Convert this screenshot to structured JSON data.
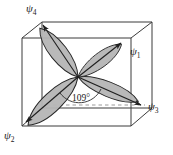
{
  "figure": {
    "labels": {
      "psi1": {
        "name": "psi",
        "subscript": "1",
        "glyph": "ψ"
      },
      "psi2": {
        "name": "psi",
        "subscript": "2",
        "glyph": "ψ"
      },
      "psi3": {
        "name": "psi",
        "subscript": "3",
        "glyph": "ψ"
      },
      "psi4": {
        "name": "psi",
        "subscript": "4",
        "glyph": "ψ"
      }
    },
    "angle_annotation": "109°",
    "colors": {
      "background": "#ffffff",
      "lobe_fill": "#b5b5b5",
      "lobe_stroke": "#262626",
      "cube_stroke": "#3b3b3b",
      "dashed_stroke": "#8f8f8f",
      "axis_stroke": "#262626",
      "text": "#1a1a1a"
    },
    "cube": {
      "front_top_left": [
        22,
        38
      ],
      "front_top_right": [
        131,
        38
      ],
      "front_bottom_left": [
        22,
        126
      ],
      "front_bottom_right": [
        131,
        126
      ],
      "back_top_left": [
        42,
        22
      ],
      "back_top_right": [
        152,
        22
      ],
      "back_bottom_left": [
        42,
        108
      ],
      "back_bottom_right": [
        152,
        108
      ]
    },
    "center": [
      78,
      77
    ],
    "lobes": [
      {
        "id": "psi1",
        "tip": [
          122,
          44
        ],
        "width": 20
      },
      {
        "id": "psi2",
        "tip": [
          25,
          122
        ],
        "width": 20
      },
      {
        "id": "psi3",
        "tip": [
          142,
          106
        ],
        "width": 18
      },
      {
        "id": "psi4",
        "tip": [
          42,
          24
        ],
        "width": 20
      }
    ],
    "dashed_guides": {
      "vertical": {
        "from": [
          42,
          24
        ],
        "to": [
          42,
          108
        ]
      },
      "horizontal": {
        "from": [
          40,
          105
        ],
        "to": [
          146,
          105
        ]
      }
    }
  }
}
